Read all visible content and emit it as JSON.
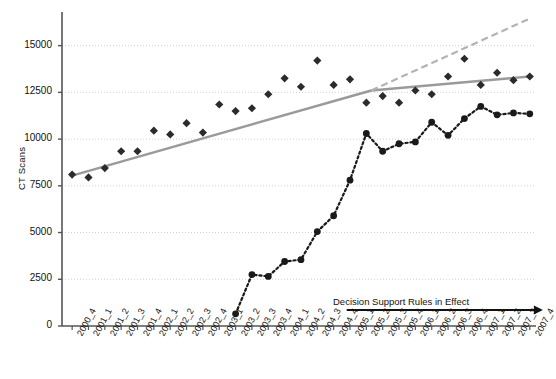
{
  "chart_data": {
    "type": "line",
    "title": "",
    "xlabel": "",
    "ylabel": "CT Scans",
    "ylim": [
      0,
      16800
    ],
    "yticks": [
      0,
      2500,
      5000,
      7500,
      10000,
      12500,
      15000
    ],
    "grid": true,
    "legend_position": "none",
    "categories": [
      "2000_4",
      "2001_1",
      "2001_2",
      "2001_3",
      "2001_4",
      "2002_1",
      "2002_2",
      "2002_3",
      "2002_4",
      "2003_1",
      "2003_2",
      "2003_3",
      "2003_4",
      "2004_1",
      "2004_2",
      "2004_3",
      "2004_4",
      "2005_1",
      "2005_2",
      "2005_3",
      "2005_4",
      "2006_1",
      "2006_2",
      "2006_3",
      "2006_4",
      "2007_1",
      "2007_2",
      "2007_3",
      "2007_4"
    ],
    "series": [
      {
        "name": "Total CT Scans",
        "marker": "diamond",
        "linestyle": "none",
        "color": "#2b2b2b",
        "values": [
          8100,
          7950,
          8450,
          9350,
          9350,
          10450,
          10250,
          10850,
          10350,
          11850,
          11500,
          11650,
          12400,
          13250,
          12800,
          14200,
          12900,
          13200,
          11950,
          12300,
          11950,
          12600,
          12400,
          13350,
          14300,
          12900,
          13550,
          13150,
          13350
        ]
      },
      {
        "name": "CT Scans With Decision Support",
        "marker": "circle",
        "linestyle": "dotted",
        "color": "#1a1a1a",
        "values": [
          null,
          null,
          null,
          null,
          null,
          null,
          null,
          null,
          null,
          null,
          650,
          2750,
          2650,
          3450,
          3550,
          5050,
          5900,
          7800,
          10300,
          9350,
          9750,
          9850,
          10900,
          10200,
          11100,
          11750,
          11300,
          11400,
          11350
        ]
      }
    ],
    "trend_lines": [
      {
        "name": "pre-intervention-trend",
        "style": "solid",
        "color": "#9a9a9a",
        "from": {
          "x_index": 0,
          "y": 8050
        },
        "to": {
          "x_index": 18.3,
          "y": 12600
        }
      },
      {
        "name": "post-intervention-trend",
        "style": "solid",
        "color": "#9a9a9a",
        "from": {
          "x_index": 18.3,
          "y": 12600
        },
        "to": {
          "x_index": 28,
          "y": 13350
        }
      },
      {
        "name": "counterfactual-projection",
        "style": "dashed",
        "color": "#b3b3b3",
        "from": {
          "x_index": 18.3,
          "y": 12600
        },
        "to": {
          "x_index": 28,
          "y": 16450
        }
      }
    ],
    "annotations": [
      {
        "name": "decision-support-rules-annotation",
        "text": "Decision Support Rules in Effect",
        "arrow": {
          "from_x_index": 16.8,
          "to_x_index": 28.8,
          "y": 850
        }
      }
    ]
  }
}
